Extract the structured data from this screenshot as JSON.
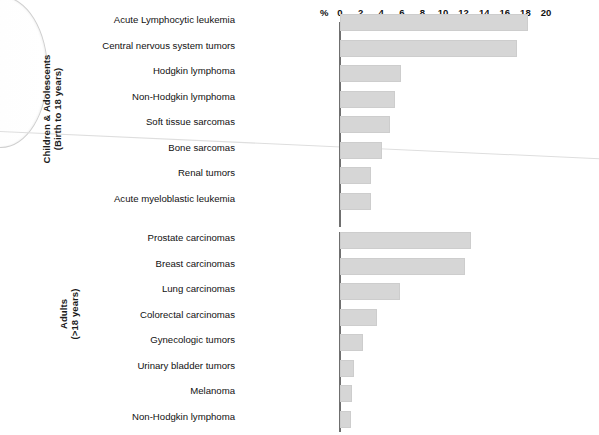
{
  "axis": {
    "percent_symbol": "%",
    "ticks": [
      0,
      2,
      4,
      6,
      8,
      10,
      12,
      14,
      16,
      18,
      20
    ],
    "min": 0,
    "max": 20,
    "unit": "%"
  },
  "groups": [
    {
      "id": "children",
      "title_line1": "Children & Adolescents",
      "title_line2": "(Birth to 18 years)",
      "title": "Children & Adolescents (Birth to 18 years)",
      "rows": [
        {
          "label": "Acute Lymphocytic leukemia",
          "value": 18.3
        },
        {
          "label": "Central nervous system tumors",
          "value": 17.2
        },
        {
          "label": "Hodgkin lymphoma",
          "value": 5.9
        },
        {
          "label": "Non-Hodgkin lymphoma",
          "value": 5.3
        },
        {
          "label": "Soft tissue sarcomas",
          "value": 4.9
        },
        {
          "label": "Bone sarcomas",
          "value": 4.1
        },
        {
          "label": "Renal tumors",
          "value": 3.0
        },
        {
          "label": "Acute myeloblastic leukemia",
          "value": 3.0
        }
      ]
    },
    {
      "id": "adults",
      "title_line1": "Adults",
      "title_line2": "(>18 years)",
      "title": "Adults (>18 years)",
      "rows": [
        {
          "label": "Prostate carcinomas",
          "value": 12.7
        },
        {
          "label": "Breast carcinomas",
          "value": 12.1
        },
        {
          "label": "Lung carcinomas",
          "value": 5.8
        },
        {
          "label": "Colorectal carcinomas",
          "value": 3.6
        },
        {
          "label": "Gynecologic tumors",
          "value": 2.2
        },
        {
          "label": "Urinary bladder tumors",
          "value": 1.4
        },
        {
          "label": "Melanoma",
          "value": 1.2
        },
        {
          "label": "Non-Hodgkin lymphoma",
          "value": 1.1
        }
      ]
    }
  ],
  "colors": {
    "bar_fill": "#d6d6d6",
    "bar_stroke": "#cdcdcd",
    "axis": "#6f6f6f",
    "text": "#111111",
    "background": "#ffffff"
  },
  "chart_data": {
    "type": "bar",
    "orientation": "horizontal",
    "title": "",
    "xlabel": "%",
    "ylabel": "",
    "xlim": [
      0,
      20
    ],
    "xticks": [
      0,
      2,
      4,
      6,
      8,
      10,
      12,
      14,
      16,
      18,
      20
    ],
    "grid": false,
    "legend": "none",
    "panels": [
      {
        "name": "Children & Adolescents (Birth to 18 years)",
        "categories": [
          "Acute Lymphocytic leukemia",
          "Central nervous system tumors",
          "Hodgkin lymphoma",
          "Non-Hodgkin lymphoma",
          "Soft tissue sarcomas",
          "Bone sarcomas",
          "Renal tumors",
          "Acute myeloblastic leukemia"
        ],
        "values": [
          18.3,
          17.2,
          5.9,
          5.3,
          4.9,
          4.1,
          3.0,
          3.0
        ]
      },
      {
        "name": "Adults (>18 years)",
        "categories": [
          "Prostate carcinomas",
          "Breast carcinomas",
          "Lung carcinomas",
          "Colorectal carcinomas",
          "Gynecologic tumors",
          "Urinary bladder tumors",
          "Melanoma",
          "Non-Hodgkin lymphoma"
        ],
        "values": [
          12.7,
          12.1,
          5.8,
          3.6,
          2.2,
          1.4,
          1.2,
          1.1
        ]
      }
    ]
  }
}
